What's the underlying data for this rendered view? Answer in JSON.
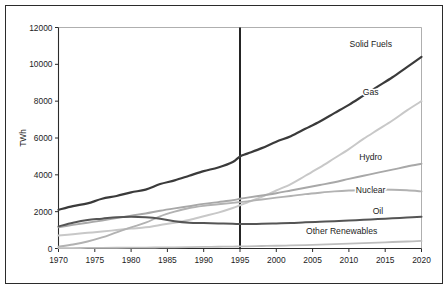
{
  "chart_data": {
    "type": "line",
    "title": "",
    "subtitle": "",
    "xlabel": "",
    "ylabel": "TWh",
    "xlim": [
      1970,
      2020
    ],
    "ylim": [
      0,
      12000
    ],
    "grid": false,
    "legend_position": "right-inline-labels",
    "x_ticks": [
      "1970",
      "1975",
      "1980",
      "1985",
      "1990",
      "1995",
      "2000",
      "2005",
      "2010",
      "2015",
      "2020"
    ],
    "y_ticks": [
      "0",
      "2000",
      "4000",
      "6000",
      "8000",
      "10000",
      "12000"
    ],
    "x": [
      1970,
      1972,
      1974,
      1976,
      1978,
      1980,
      1982,
      1984,
      1986,
      1988,
      1990,
      1992,
      1994,
      1995,
      1996,
      1998,
      2000,
      2002,
      2004,
      2006,
      2008,
      2010,
      2012,
      2014,
      2016,
      2018,
      2020
    ],
    "annotations": [
      {
        "name": "projection-divider",
        "type": "vline",
        "x": 1995,
        "label": ""
      }
    ],
    "series": [
      {
        "name": "Solid Fuels",
        "color": "#3a3a3a",
        "width": 2.2,
        "label_x": 2013,
        "label_y": 10950,
        "values": [
          2100,
          2300,
          2450,
          2700,
          2850,
          3050,
          3200,
          3500,
          3700,
          3950,
          4200,
          4400,
          4700,
          5000,
          5150,
          5450,
          5800,
          6100,
          6500,
          6900,
          7350,
          7800,
          8300,
          8800,
          9300,
          9850,
          10400
        ]
      },
      {
        "name": "Gas",
        "color": "#c8c8c8",
        "width": 2.0,
        "label_x": 2013,
        "label_y": 8350,
        "values": [
          700,
          780,
          850,
          920,
          1000,
          1080,
          1150,
          1280,
          1400,
          1550,
          1750,
          1950,
          2200,
          2350,
          2500,
          2800,
          3150,
          3500,
          3950,
          4400,
          4900,
          5400,
          5950,
          6450,
          6950,
          7500,
          8000
        ]
      },
      {
        "name": "Hydro",
        "color": "#a8a8a8",
        "width": 1.9,
        "label_x": 2013,
        "label_y": 4800,
        "values": [
          1150,
          1280,
          1400,
          1520,
          1650,
          1780,
          1900,
          2050,
          2180,
          2300,
          2420,
          2520,
          2620,
          2700,
          2760,
          2880,
          3000,
          3150,
          3300,
          3450,
          3600,
          3780,
          3950,
          4120,
          4280,
          4450,
          4600
        ]
      },
      {
        "name": "Nuclear",
        "color": "#b2b2b2",
        "width": 1.9,
        "label_x": 2013,
        "label_y": 3000,
        "values": [
          100,
          220,
          380,
          600,
          880,
          1150,
          1400,
          1750,
          2000,
          2200,
          2320,
          2400,
          2480,
          2520,
          2560,
          2660,
          2760,
          2850,
          2950,
          3030,
          3100,
          3150,
          3180,
          3200,
          3190,
          3160,
          3100
        ]
      },
      {
        "name": "Oil",
        "color": "#555555",
        "width": 2.0,
        "label_x": 2014,
        "label_y": 1900,
        "values": [
          1200,
          1400,
          1550,
          1620,
          1700,
          1720,
          1700,
          1620,
          1480,
          1400,
          1380,
          1360,
          1340,
          1330,
          1330,
          1340,
          1360,
          1380,
          1420,
          1450,
          1480,
          1520,
          1560,
          1600,
          1640,
          1680,
          1720
        ]
      },
      {
        "name": "Other Renewables",
        "color": "#bdbdbd",
        "width": 1.8,
        "label_x": 2009,
        "label_y": 780,
        "values": [
          20,
          25,
          30,
          35,
          40,
          45,
          50,
          58,
          66,
          75,
          85,
          95,
          105,
          112,
          120,
          135,
          150,
          168,
          188,
          210,
          235,
          262,
          292,
          322,
          352,
          380,
          410
        ]
      }
    ]
  }
}
